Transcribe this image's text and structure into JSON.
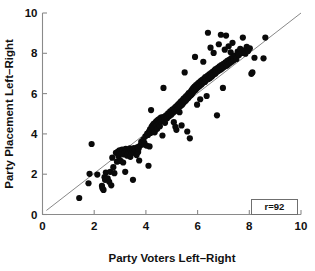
{
  "chart_data": {
    "type": "scatter",
    "title": "",
    "xlabel": "Party Voters Left–Right",
    "ylabel": "Party Placement Left–Right",
    "xlim": [
      0,
      10
    ],
    "ylim": [
      0,
      10
    ],
    "xticks": [
      0,
      2,
      4,
      6,
      8,
      10
    ],
    "yticks": [
      0,
      2,
      4,
      6,
      8,
      10
    ],
    "xtick_labels": [
      "0",
      "2",
      "4",
      "6",
      "8",
      "10"
    ],
    "ytick_labels": [
      "0",
      "2",
      "4",
      "6",
      "8",
      "10"
    ],
    "grid": false,
    "legend_position": "bottom-right",
    "annotations": [
      {
        "name": "correlation-box",
        "text": "r=92"
      }
    ],
    "reference_line": {
      "name": "diagonal-45",
      "from": [
        0.15,
        0.2
      ],
      "to": [
        10.0,
        10.0
      ],
      "color": "#7a7a7a"
    },
    "marker": {
      "shape": "circle",
      "color": "#0a0a0a",
      "size": 3.1
    },
    "series": [
      {
        "name": "parties",
        "n": 221,
        "points": [
          [
            1.42,
            0.82
          ],
          [
            1.78,
            1.55
          ],
          [
            1.82,
            2.02
          ],
          [
            1.9,
            3.5
          ],
          [
            2.12,
            1.98
          ],
          [
            2.3,
            1.42
          ],
          [
            2.32,
            1.3
          ],
          [
            2.36,
            1.22
          ],
          [
            2.4,
            1.85
          ],
          [
            2.42,
            1.72
          ],
          [
            2.45,
            2.08
          ],
          [
            2.52,
            1.8
          ],
          [
            2.58,
            1.62
          ],
          [
            2.62,
            2.12
          ],
          [
            2.66,
            1.45
          ],
          [
            2.7,
            2.82
          ],
          [
            2.74,
            2.35
          ],
          [
            2.78,
            2.05
          ],
          [
            2.84,
            3.06
          ],
          [
            2.88,
            2.62
          ],
          [
            2.92,
            3.12
          ],
          [
            2.95,
            2.88
          ],
          [
            2.98,
            3.18
          ],
          [
            3.02,
            2.66
          ],
          [
            3.05,
            3.04
          ],
          [
            3.08,
            3.22
          ],
          [
            3.12,
            2.58
          ],
          [
            3.15,
            2.98
          ],
          [
            3.18,
            3.08
          ],
          [
            3.2,
            2.12
          ],
          [
            3.22,
            3.26
          ],
          [
            3.25,
            3.14
          ],
          [
            3.28,
            2.92
          ],
          [
            3.3,
            3.02
          ],
          [
            3.33,
            3.18
          ],
          [
            3.35,
            3.1
          ],
          [
            3.38,
            3.28
          ],
          [
            3.4,
            2.86
          ],
          [
            3.42,
            3.2
          ],
          [
            3.44,
            3.12
          ],
          [
            3.46,
            3.05
          ],
          [
            3.48,
            3.22
          ],
          [
            3.5,
            1.72
          ],
          [
            3.52,
            3.15
          ],
          [
            3.54,
            3.3
          ],
          [
            3.56,
            3.08
          ],
          [
            3.58,
            3.18
          ],
          [
            3.6,
            3.25
          ],
          [
            3.62,
            3.12
          ],
          [
            3.64,
            2.95
          ],
          [
            3.66,
            3.2
          ],
          [
            3.68,
            3.35
          ],
          [
            3.7,
            3.1
          ],
          [
            3.72,
            3.28
          ],
          [
            3.74,
            2.68
          ],
          [
            3.78,
            3.42
          ],
          [
            3.82,
            3.6
          ],
          [
            3.86,
            3.48
          ],
          [
            3.9,
            3.72
          ],
          [
            3.94,
            3.55
          ],
          [
            3.98,
            3.88
          ],
          [
            4.02,
            3.42
          ],
          [
            4.05,
            4.02
          ],
          [
            4.08,
            3.95
          ],
          [
            4.1,
            2.42
          ],
          [
            4.12,
            4.12
          ],
          [
            4.14,
            3.38
          ],
          [
            4.16,
            4.22
          ],
          [
            4.18,
            4.05
          ],
          [
            4.2,
            5.18
          ],
          [
            4.22,
            4.35
          ],
          [
            4.24,
            4.18
          ],
          [
            4.26,
            4.42
          ],
          [
            4.28,
            4.28
          ],
          [
            4.3,
            4.5
          ],
          [
            4.32,
            4.32
          ],
          [
            4.34,
            4.08
          ],
          [
            4.36,
            4.55
          ],
          [
            4.38,
            4.4
          ],
          [
            4.4,
            4.62
          ],
          [
            4.42,
            4.45
          ],
          [
            4.44,
            4.25
          ],
          [
            4.46,
            4.68
          ],
          [
            4.48,
            4.52
          ],
          [
            4.5,
            4.72
          ],
          [
            4.52,
            4.58
          ],
          [
            4.54,
            4.38
          ],
          [
            4.56,
            4.78
          ],
          [
            4.58,
            4.62
          ],
          [
            4.6,
            4.82
          ],
          [
            4.62,
            4.68
          ],
          [
            4.64,
            3.92
          ],
          [
            4.66,
            4.75
          ],
          [
            4.68,
            6.28
          ],
          [
            4.7,
            4.85
          ],
          [
            4.72,
            4.7
          ],
          [
            4.74,
            4.55
          ],
          [
            4.78,
            4.92
          ],
          [
            4.82,
            4.78
          ],
          [
            4.86,
            5.02
          ],
          [
            4.9,
            4.88
          ],
          [
            4.94,
            5.12
          ],
          [
            4.98,
            4.95
          ],
          [
            5.02,
            5.2
          ],
          [
            5.05,
            5.05
          ],
          [
            5.08,
            4.58
          ],
          [
            5.1,
            5.28
          ],
          [
            5.12,
            5.12
          ],
          [
            5.14,
            4.35
          ],
          [
            5.16,
            5.35
          ],
          [
            5.18,
            4.2
          ],
          [
            5.2,
            5.18
          ],
          [
            5.22,
            5.42
          ],
          [
            5.24,
            5.25
          ],
          [
            5.26,
            5.48
          ],
          [
            5.28,
            5.32
          ],
          [
            5.3,
            5.08
          ],
          [
            5.32,
            5.55
          ],
          [
            5.34,
            5.38
          ],
          [
            5.36,
            5.62
          ],
          [
            5.38,
            4.42
          ],
          [
            5.4,
            5.45
          ],
          [
            5.42,
            5.68
          ],
          [
            5.44,
            5.52
          ],
          [
            5.46,
            5.75
          ],
          [
            5.48,
            5.58
          ],
          [
            5.5,
            7.05
          ],
          [
            5.52,
            5.82
          ],
          [
            5.54,
            5.65
          ],
          [
            5.56,
            5.88
          ],
          [
            5.58,
            5.72
          ],
          [
            5.6,
            4.12
          ],
          [
            5.62,
            5.95
          ],
          [
            5.64,
            5.78
          ],
          [
            5.66,
            6.02
          ],
          [
            5.68,
            5.85
          ],
          [
            5.7,
            3.78
          ],
          [
            5.72,
            6.08
          ],
          [
            5.74,
            5.92
          ],
          [
            5.76,
            6.15
          ],
          [
            5.78,
            5.98
          ],
          [
            5.8,
            6.22
          ],
          [
            5.82,
            6.05
          ],
          [
            5.84,
            6.28
          ],
          [
            5.86,
            6.12
          ],
          [
            5.88,
            6.35
          ],
          [
            5.9,
            7.82
          ],
          [
            5.92,
            6.18
          ],
          [
            5.94,
            6.42
          ],
          [
            5.96,
            6.25
          ],
          [
            5.98,
            5.45
          ],
          [
            6.0,
            6.48
          ],
          [
            6.02,
            6.32
          ],
          [
            6.05,
            6.55
          ],
          [
            6.08,
            6.38
          ],
          [
            6.1,
            5.72
          ],
          [
            6.12,
            6.62
          ],
          [
            6.15,
            6.45
          ],
          [
            6.18,
            6.68
          ],
          [
            6.2,
            6.52
          ],
          [
            6.22,
            7.58
          ],
          [
            6.25,
            6.75
          ],
          [
            6.28,
            6.58
          ],
          [
            6.3,
            6.82
          ],
          [
            6.32,
            6.65
          ],
          [
            6.35,
            5.88
          ],
          [
            6.38,
            6.88
          ],
          [
            6.4,
            9.02
          ],
          [
            6.42,
            6.72
          ],
          [
            6.45,
            6.95
          ],
          [
            6.48,
            6.78
          ],
          [
            6.5,
            8.28
          ],
          [
            6.52,
            7.02
          ],
          [
            6.55,
            6.85
          ],
          [
            6.58,
            7.08
          ],
          [
            6.6,
            6.92
          ],
          [
            6.62,
            8.02
          ],
          [
            6.65,
            7.15
          ],
          [
            6.68,
            6.98
          ],
          [
            6.7,
            7.22
          ],
          [
            6.72,
            7.05
          ],
          [
            6.75,
            4.92
          ],
          [
            6.78,
            7.28
          ],
          [
            6.8,
            7.12
          ],
          [
            6.82,
            8.45
          ],
          [
            6.85,
            7.35
          ],
          [
            6.88,
            7.18
          ],
          [
            6.9,
            8.92
          ],
          [
            6.92,
            7.42
          ],
          [
            6.95,
            7.25
          ],
          [
            6.98,
            6.28
          ],
          [
            7.0,
            7.48
          ],
          [
            7.02,
            7.32
          ],
          [
            7.05,
            8.18
          ],
          [
            7.08,
            7.55
          ],
          [
            7.1,
            8.88
          ],
          [
            7.12,
            7.38
          ],
          [
            7.15,
            7.62
          ],
          [
            7.18,
            7.45
          ],
          [
            7.2,
            8.35
          ],
          [
            7.22,
            7.68
          ],
          [
            7.25,
            7.52
          ],
          [
            7.28,
            8.05
          ],
          [
            7.3,
            7.75
          ],
          [
            7.32,
            7.58
          ],
          [
            7.35,
            8.52
          ],
          [
            7.38,
            7.82
          ],
          [
            7.4,
            7.65
          ],
          [
            7.45,
            7.88
          ],
          [
            7.5,
            7.72
          ],
          [
            7.55,
            8.08
          ],
          [
            7.6,
            7.92
          ],
          [
            7.65,
            8.22
          ],
          [
            7.7,
            8.02
          ],
          [
            7.75,
            8.78
          ],
          [
            7.8,
            8.15
          ],
          [
            7.85,
            7.98
          ],
          [
            7.9,
            8.32
          ],
          [
            7.95,
            8.12
          ],
          [
            8.02,
            8.25
          ],
          [
            8.08,
            6.98
          ],
          [
            8.12,
            7.05
          ],
          [
            8.2,
            7.78
          ],
          [
            8.55,
            7.75
          ],
          [
            8.62,
            8.78
          ]
        ]
      }
    ]
  },
  "axes": {
    "x_title": "Party Voters Left–Right",
    "y_title": "Party Placement Left–Right"
  },
  "legend": {
    "correlation_label": "r=92"
  }
}
